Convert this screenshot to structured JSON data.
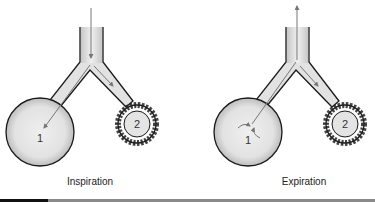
{
  "panels": [
    {
      "caption": "Inspiration",
      "alveolus_1_label": "1",
      "alveolus_2_label": "2",
      "airflow": "downward into both alveoli"
    },
    {
      "caption": "Expiration",
      "alveolus_1_label": "1",
      "alveolus_2_label": "2",
      "airflow": "upward out of airway; swirl in alveolus 1, flow into alveolus 2"
    }
  ],
  "colors": {
    "fill": "#e0e0e0",
    "outline": "#1a1a1a",
    "arrow": "#777777",
    "bar_dark": "#111111",
    "bar_gray": "#8a8a8a"
  }
}
